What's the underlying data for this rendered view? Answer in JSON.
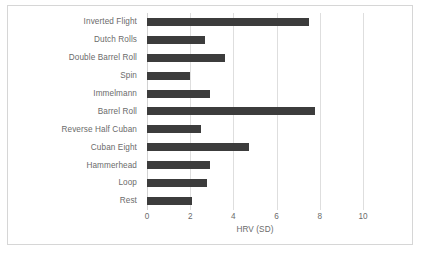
{
  "chart_data": {
    "type": "bar",
    "orientation": "horizontal",
    "title": "",
    "xlabel": "HRV (SD)",
    "ylabel": "",
    "xlim": [
      0,
      10
    ],
    "xticks": [
      0,
      2,
      4,
      6,
      8,
      10
    ],
    "grid": true,
    "legend": false,
    "categories": [
      "Inverted Flight",
      "Dutch Rolls",
      "Double Barrel Roll",
      "Spin",
      "Immelmann",
      "Barrel Roll",
      "Reverse Half Cuban",
      "Cuban Eight",
      "Hammerhead",
      "Loop",
      "Rest"
    ],
    "values": [
      7.5,
      2.7,
      3.6,
      2.0,
      2.9,
      7.8,
      2.5,
      4.7,
      2.9,
      2.8,
      2.1
    ]
  },
  "style": {
    "bar_color": "#3c3c3c",
    "grid_color": "#dedede",
    "text_color": "#6b6b6b",
    "background": "#ffffff",
    "frame_color": "#d6d6d6"
  }
}
